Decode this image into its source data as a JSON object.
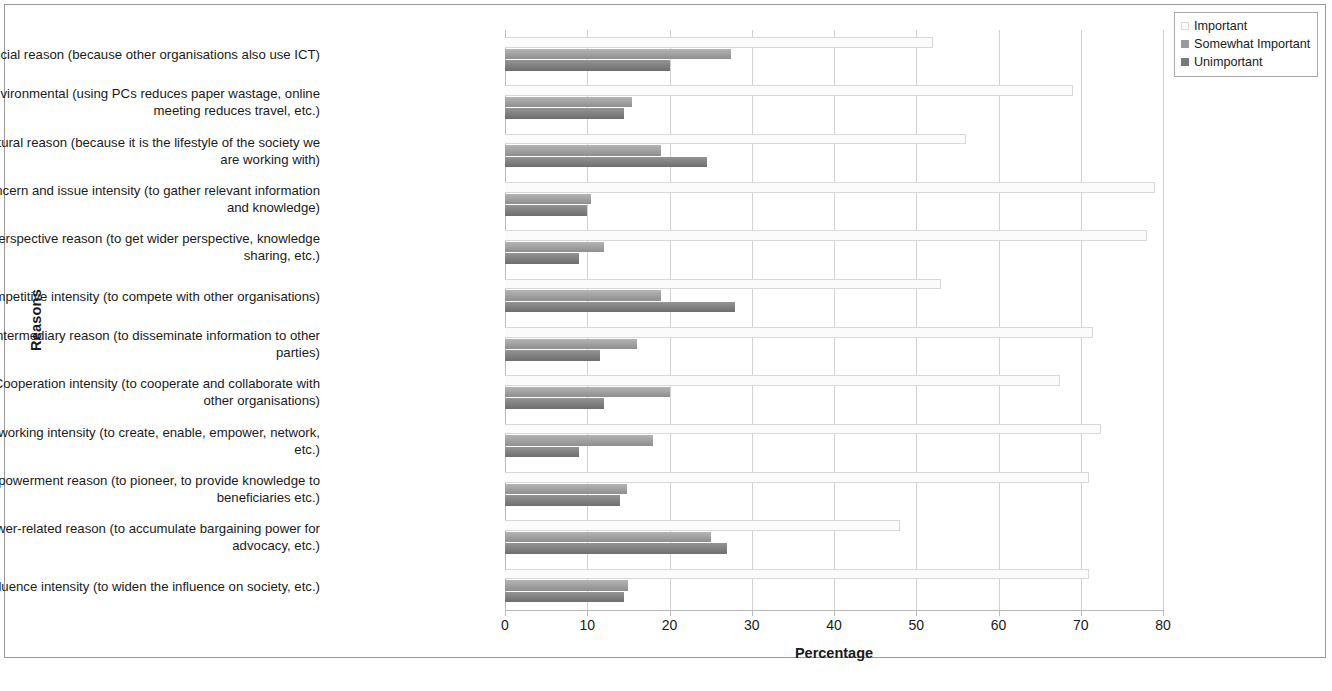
{
  "chart_data": {
    "type": "bar",
    "orientation": "horizontal",
    "title": "",
    "xlabel": "Percentage",
    "ylabel": "Reasons",
    "xlim": [
      0,
      80
    ],
    "xticks": [
      0,
      10,
      20,
      30,
      40,
      50,
      60,
      70,
      80
    ],
    "grid": true,
    "legend_position": "top-right",
    "legend_title": "",
    "categories": [
      "Social reason (because other organisations also use ICT)",
      "Environmental (using PCs reduces paper wastage, online\nmeeting reduces travel, etc.)",
      "Cultural reason (because it is the lifestyle of the society we\nare working with)",
      "Concern and issue intensity (to gather relevant information\nand knowledge)",
      "Perspective reason (to get wider perspective, knowledge\nsharing, etc.)",
      "Competitive intensity (to compete with other organisations)",
      "Intermediary reason (to disseminate information to other\nparties)",
      "Cooperation intensity (to cooperate and collaborate with\nother organisations)",
      "Networking intensity (to create, enable, empower, network,\netc.)",
      "Empowerment reason (to pioneer, to provide knowledge to\nbeneficiaries etc.)",
      "Power-related reason (to accumulate bargaining power for\nadvocacy, etc.)",
      "Influence intensity (to widen the influence on society, etc.)"
    ],
    "series": [
      {
        "name": "Important",
        "color": "#fbfbfb",
        "values": [
          52.0,
          69.0,
          56.0,
          79.0,
          78.0,
          53.0,
          71.5,
          67.5,
          72.5,
          71.0,
          48.0,
          71.0
        ]
      },
      {
        "name": "Somewhat Important",
        "color": "#9a9a9a",
        "values": [
          27.5,
          15.5,
          19.0,
          10.5,
          12.0,
          19.0,
          16.0,
          20.0,
          18.0,
          14.8,
          25.0,
          15.0
        ]
      },
      {
        "name": "Unimportant",
        "color": "#7a7a7a",
        "values": [
          20.0,
          14.5,
          24.5,
          10.0,
          9.0,
          28.0,
          11.5,
          12.0,
          9.0,
          14.0,
          27.0,
          14.5
        ]
      }
    ]
  }
}
